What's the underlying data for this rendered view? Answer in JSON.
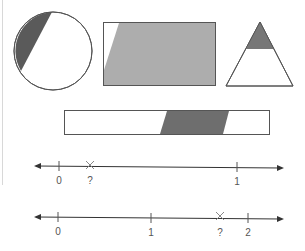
{
  "colors": {
    "outline": "#555555",
    "dark_fill": "#5a5a5a",
    "light_fill": "#adadad",
    "line": "#333333",
    "label": "#555555"
  },
  "shapes": [
    {
      "name": "circle",
      "shading": "small dark segment on left"
    },
    {
      "name": "rectangle",
      "shading": "large light gray region, small white corner at left"
    },
    {
      "name": "triangle",
      "shading": "top dark section"
    },
    {
      "name": "bar",
      "shading": "dark parallelogram section in middle-right"
    }
  ],
  "number_lines": [
    {
      "ticks": [
        {
          "label": "0",
          "value": 0
        },
        {
          "label": "1",
          "value": 1
        }
      ],
      "marker": {
        "label": "?",
        "symbol": "×"
      }
    },
    {
      "ticks": [
        {
          "label": "0",
          "value": 0
        },
        {
          "label": "1",
          "value": 1
        },
        {
          "label": "2",
          "value": 2
        }
      ],
      "marker": {
        "label": "?",
        "symbol": "×"
      }
    }
  ]
}
